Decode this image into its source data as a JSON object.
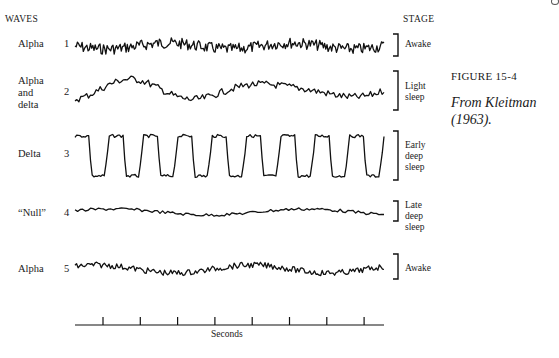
{
  "figure": {
    "header_left": "WAVES",
    "header_right": "STAGE",
    "caption_title": "FIGURE 15-4",
    "caption_source_line1": "From Kleitman",
    "caption_source_line2": "(1963).",
    "time_axis_label": "Seconds",
    "time_axis_tick_count": 8,
    "rows": [
      {
        "number": "1",
        "wave": [
          "Alpha"
        ],
        "stage": [
          "Awake"
        ],
        "character": "fast low-amplitude irregular"
      },
      {
        "number": "2",
        "wave": [
          "Alpha",
          "and",
          "delta"
        ],
        "stage": [
          "Light",
          "sleep"
        ],
        "character": "mixed"
      },
      {
        "number": "3",
        "wave": [
          "Delta"
        ],
        "stage": [
          "Early",
          "deep",
          "sleep"
        ],
        "character": "slow high-amplitude"
      },
      {
        "number": "4",
        "wave": [
          "“Null”"
        ],
        "stage": [
          "Late",
          "deep",
          "sleep"
        ],
        "character": "flat low-amplitude"
      },
      {
        "number": "5",
        "wave": [
          "Alpha"
        ],
        "stage": [
          "Awake"
        ],
        "character": "fast low-amplitude irregular"
      }
    ]
  }
}
